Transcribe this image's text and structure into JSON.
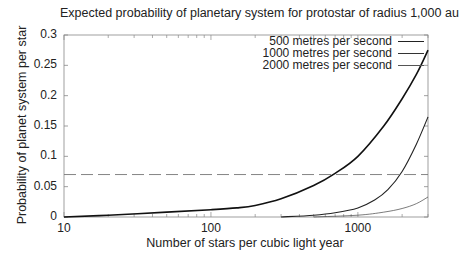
{
  "chart_data": {
    "type": "line",
    "title": "Expected probability of planetary system for protostar of radius 1,000 au",
    "xlabel": "Number of stars per cubic light year",
    "ylabel": "Probability of planet system per star",
    "xscale": "log",
    "xlim": [
      10,
      3000
    ],
    "ylim": [
      0,
      0.3
    ],
    "xticks": [
      "10",
      "100",
      "1000"
    ],
    "yticks": [
      "0",
      "0.05",
      "0.1",
      "0.15",
      "0.2",
      "0.25",
      "0.3"
    ],
    "legend_position": "top-right",
    "grid": false,
    "series": [
      {
        "name": "500 metres per second",
        "line_width": 1.6,
        "x": [
          10,
          20,
          50,
          100,
          150,
          200,
          300,
          500,
          700,
          1000,
          1500,
          2000,
          2500,
          3000
        ],
        "y": [
          0,
          0.003,
          0.008,
          0.012,
          0.015,
          0.019,
          0.03,
          0.052,
          0.072,
          0.1,
          0.15,
          0.195,
          0.235,
          0.275
        ]
      },
      {
        "name": "1000 metres per second",
        "line_width": 1.1,
        "x": [
          300,
          500,
          700,
          1000,
          1300,
          1600,
          2000,
          2500,
          3000
        ],
        "y": [
          0,
          0.003,
          0.007,
          0.015,
          0.028,
          0.045,
          0.075,
          0.12,
          0.165
        ]
      },
      {
        "name": "2000 metres per second",
        "line_width": 0.7,
        "x": [
          500,
          1000,
          1500,
          2000,
          2500,
          3000
        ],
        "y": [
          0,
          0.003,
          0.008,
          0.014,
          0.022,
          0.033
        ]
      }
    ],
    "reference_lines": [
      {
        "type": "horizontal",
        "y": 0.07,
        "style": "dashed"
      }
    ]
  },
  "labels": {
    "title": "Expected probability of planetary system for protostar of radius 1,000 au",
    "xlabel": "Number of stars per cubic light year",
    "ylabel": "Probability of planet system per star",
    "legend": [
      "500 metres per second",
      "1000 metres per second",
      "2000 metres per second"
    ]
  }
}
